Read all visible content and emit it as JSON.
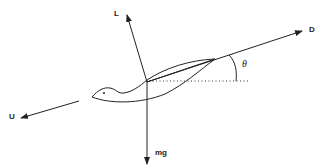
{
  "diagram": {
    "type": "force-diagram",
    "colors": {
      "line": "#222222",
      "background": "#ffffff"
    },
    "labels": {
      "lift": "L",
      "drag": "D",
      "velocity": "U",
      "weight": "mg",
      "angle": "θ"
    },
    "vectors": [
      {
        "name": "lift",
        "label": "L",
        "direction": "up-left, perpendicular to D"
      },
      {
        "name": "drag",
        "label": "D",
        "direction": "up-right along glide path"
      },
      {
        "name": "velocity",
        "label": "U",
        "direction": "down-left"
      },
      {
        "name": "weight",
        "label": "mg",
        "direction": "vertically down"
      }
    ],
    "reference_line": "dotted horizontal",
    "angle_annotation": "θ between drag line and horizontal"
  }
}
